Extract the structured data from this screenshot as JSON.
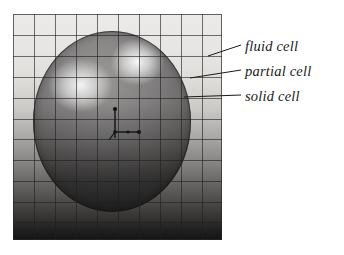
{
  "figure": {
    "panel": {
      "columns": 10,
      "rows": 11,
      "grid_visible": true,
      "background_description": "vertical gradient, light at top to near-black at bottom"
    },
    "sphere": {
      "description": "shaded sphere with two specular highlights",
      "highlights": 2
    },
    "axes_marker": {
      "description": "small coordinate axis triad near the sphere centre"
    }
  },
  "callouts": [
    {
      "id": "fluid",
      "label": "fluid cell"
    },
    {
      "id": "partial",
      "label": "partial cell"
    },
    {
      "id": "solid",
      "label": "solid cell"
    }
  ],
  "colors": {
    "page_background": "#ffffff",
    "grid_line": "#1e1e1e",
    "label_text": "#1a1a1a",
    "leader_line": "#1a1a1a",
    "panel_light": "#f0efed",
    "panel_dark": "#121111"
  }
}
